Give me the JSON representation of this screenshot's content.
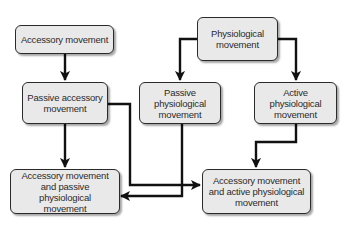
{
  "diagram": {
    "type": "flowchart",
    "nodes": [
      {
        "id": "accessory",
        "label": "Accessory movement"
      },
      {
        "id": "physiological",
        "label": "Physiological\nmovement"
      },
      {
        "id": "passive_accessory",
        "label": "Passive accessory\nmovement"
      },
      {
        "id": "passive_physiological",
        "label": "Passive\nphysiological\nmovement"
      },
      {
        "id": "active_physiological",
        "label": "Active\nphysiological\nmovement"
      },
      {
        "id": "acc_passive_phys",
        "label": "Accessory movement\nand passive physiological\nmovement"
      },
      {
        "id": "acc_active_phys",
        "label": "Accessory movement\nand active physiological\nmovement"
      }
    ],
    "edges": [
      {
        "from": "accessory",
        "to": "passive_accessory"
      },
      {
        "from": "physiological",
        "to": "passive_physiological"
      },
      {
        "from": "physiological",
        "to": "active_physiological"
      },
      {
        "from": "passive_accessory",
        "to": "acc_passive_phys"
      },
      {
        "from": "passive_accessory",
        "to": "acc_active_phys"
      },
      {
        "from": "passive_physiological",
        "to": "acc_passive_phys"
      },
      {
        "from": "active_physiological",
        "to": "acc_active_phys"
      }
    ],
    "colors": {
      "box_fill": "#e9e9e9",
      "box_border": "#2a2a2a",
      "arrow": "#111111",
      "text": "#2b2b2b"
    }
  }
}
